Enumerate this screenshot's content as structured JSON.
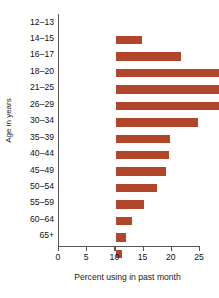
{
  "chart_data": {
    "type": "bar",
    "orientation": "horizontal",
    "title": "",
    "xlabel": "Percent using in past month",
    "ylabel": "Age in years",
    "xlim": [
      0,
      25
    ],
    "ylim": null,
    "grid": false,
    "legend": null,
    "bar_color": "#b0462a",
    "axis_color": "#555555",
    "xticks": [
      0,
      5,
      10,
      15,
      20,
      25
    ],
    "xtick_labels": [
      "0",
      "5",
      "10",
      "15",
      "20",
      "25"
    ],
    "categories": [
      "12–13",
      "14–15",
      "16–17",
      "18–20",
      "21–25",
      "26–29",
      "30–34",
      "35–39",
      "40–44",
      "45–49",
      "50–54",
      "55–59",
      "60–64",
      "65+"
    ],
    "values": [
      4.6,
      11.6,
      20.2,
      24.3,
      18.9,
      14.5,
      9.6,
      9.4,
      8.8,
      7.3,
      5.0,
      2.9,
      1.8,
      1.1
    ]
  }
}
